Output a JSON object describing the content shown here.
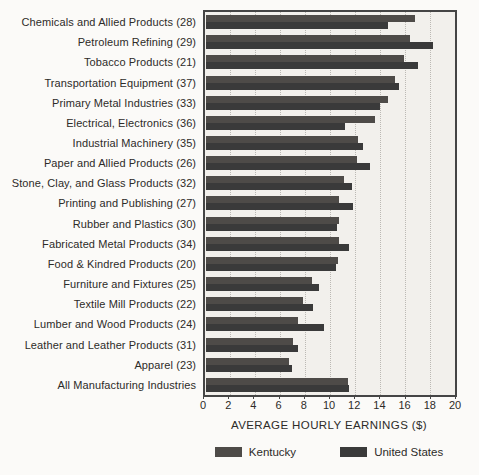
{
  "colors": {
    "kentucky": "#4e4b48",
    "united_states": "#3a3a3a",
    "plot_background": "#f2f0ec",
    "page_background": "#fbfaf8",
    "gridline": "#bcb9b4",
    "frame": "#454545",
    "text": "#2d2b28"
  },
  "chart_data": {
    "type": "bar",
    "orientation": "horizontal",
    "title": "",
    "xlabel": "AVERAGE HOURLY EARNINGS ($)",
    "ylabel": "",
    "xlim": [
      0,
      20
    ],
    "xticks": [
      0,
      2,
      4,
      6,
      8,
      10,
      12,
      14,
      16,
      18,
      20
    ],
    "grid": "vertical dotted gridlines at every tick",
    "legend_position": "bottom",
    "categories": [
      "Chemicals and Allied Products (28)",
      "Petroleum Refining (29)",
      "Tobacco Products (21)",
      "Transportation Equipment (37)",
      "Primary Metal Industries (33)",
      "Electrical, Electronics (36)",
      "Industrial Machinery (35)",
      "Paper and Allied Products (26)",
      "Stone, Clay, and Glass Products (32)",
      "Printing and Publishing (27)",
      "Rubber and Plastics (30)",
      "Fabricated Metal Products (34)",
      "Food & Kindred Products (20)",
      "Furniture and Fixtures (25)",
      "Textile Mill Products (22)",
      "Lumber and Wood Products (24)",
      "Leather and Leather Products (31)",
      "Apparel (23)",
      "All Manufacturing Industries"
    ],
    "series": [
      {
        "name": "Kentucky",
        "color": "#4e4b48",
        "values": [
          16.8,
          16.4,
          15.9,
          15.2,
          14.6,
          13.6,
          12.2,
          12.1,
          11.1,
          10.7,
          10.7,
          10.7,
          10.6,
          8.5,
          7.8,
          7.4,
          7.0,
          6.7,
          11.4
        ]
      },
      {
        "name": "United States",
        "color": "#3a3a3a",
        "values": [
          14.6,
          18.2,
          17.0,
          15.5,
          14.0,
          11.2,
          12.6,
          13.2,
          11.7,
          11.8,
          10.5,
          11.5,
          10.4,
          9.1,
          8.6,
          9.5,
          7.4,
          6.9,
          11.5
        ]
      }
    ]
  }
}
